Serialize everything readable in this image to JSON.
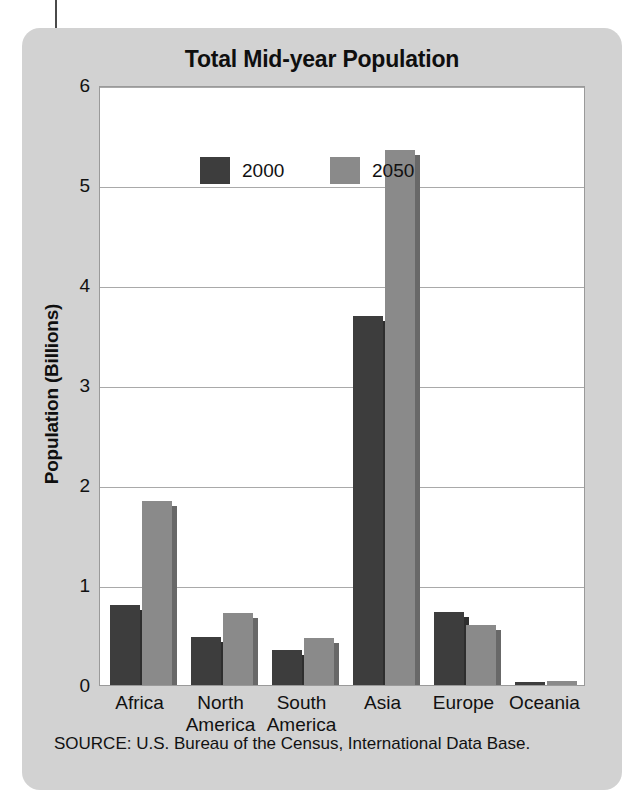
{
  "chart_data": {
    "type": "bar",
    "title": "Total Mid-year Population",
    "xlabel": "",
    "ylabel": "Population (Billions)",
    "categories": [
      "Africa",
      "North America",
      "South America",
      "Asia",
      "Europe",
      "Oceania"
    ],
    "category_lines": [
      [
        "Africa"
      ],
      [
        "North",
        "America"
      ],
      [
        "South",
        "America"
      ],
      [
        "Asia"
      ],
      [
        "Europe"
      ],
      [
        "Oceania"
      ]
    ],
    "series": [
      {
        "name": "2000",
        "color": "#3d3d3d",
        "values": [
          0.8,
          0.48,
          0.35,
          3.69,
          0.73,
          0.03
        ]
      },
      {
        "name": "2050",
        "color": "#8a8a8a",
        "values": [
          1.84,
          0.72,
          0.47,
          5.35,
          0.6,
          0.04
        ]
      }
    ],
    "ylim": [
      0,
      6
    ],
    "yticks": [
      0,
      1,
      2,
      3,
      4,
      5,
      6
    ],
    "ytick_labels": [
      "0",
      "1",
      "2",
      "3",
      "4",
      "5",
      "6"
    ],
    "grid": true,
    "legend_position": "top-left-inside"
  },
  "source": {
    "note": "SOURCE: U.S. Bureau of the Census, International Data Base."
  },
  "colors": {
    "panel_background": "#d2d2d2",
    "plot_background": "#ffffff",
    "gridline": "#a9a9a9",
    "series_2000": "#3d3d3d",
    "series_2050": "#8a8a8a",
    "text": "#111111"
  }
}
